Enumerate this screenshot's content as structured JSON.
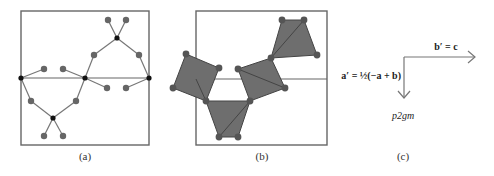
{
  "colors": {
    "frame": "#666666",
    "bond": "#777777",
    "atom_gray": "#666666",
    "atom_black": "#111111",
    "polyhedron_fill": "#6e6e6e",
    "polyhedron_edge": "#444444"
  },
  "panels": {
    "a": {
      "caption": "(a)"
    },
    "b": {
      "caption": "(b)"
    },
    "c": {
      "caption": "(c)",
      "b_prime_label": "b′ = c",
      "a_prime_label": "a′ = ½(−a + b)",
      "space_group": "p2gm"
    }
  }
}
